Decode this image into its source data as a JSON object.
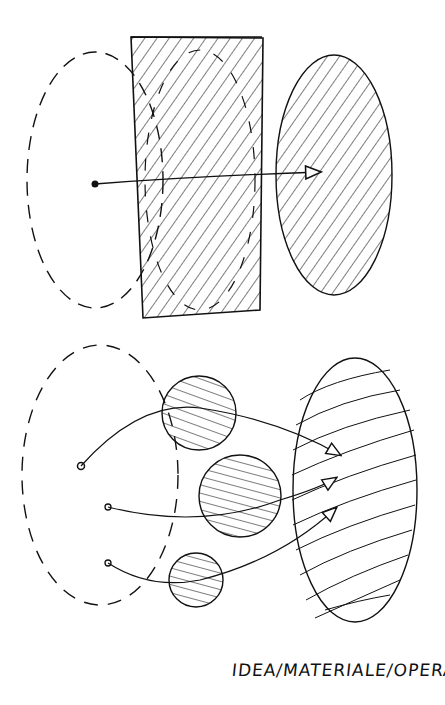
{
  "caption": "IDEA/MATERIALE/OPERA",
  "colors": {
    "ink": "#111111",
    "paper": "#ffffff"
  },
  "diagram": {
    "top": {
      "idea_shape": "dashed-ellipse",
      "material_shape": "hatched-rectangle",
      "work_shape": "hatched-ellipse",
      "arrows": 1
    },
    "bottom": {
      "idea_shape": "dashed-ellipse",
      "material_shapes": [
        "hatched-circle",
        "hatched-circle",
        "hatched-circle"
      ],
      "work_shape": "wavy-hatched-ellipse",
      "arrows": 3
    }
  }
}
